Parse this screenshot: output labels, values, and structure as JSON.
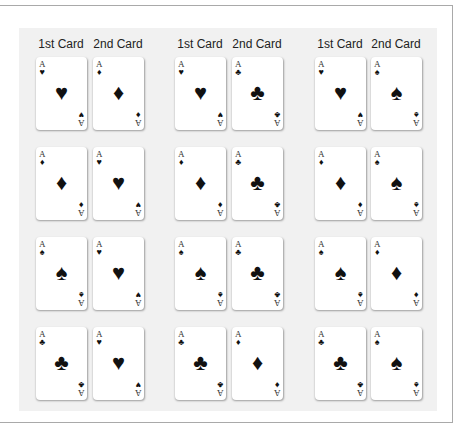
{
  "headers": [
    "1st Card",
    "2nd Card",
    "1st Card",
    "2nd Card",
    "1st Card",
    "2nd Card"
  ],
  "suit_glyphs": {
    "hearts": "♥",
    "diamonds": "♦",
    "spades": "♠",
    "clubs": "♣"
  },
  "rank": "A",
  "rows": [
    {
      "pairs": [
        {
          "first": "hearts",
          "second": "diamonds"
        },
        {
          "first": "hearts",
          "second": "clubs"
        },
        {
          "first": "hearts",
          "second": "spades"
        }
      ]
    },
    {
      "pairs": [
        {
          "first": "diamonds",
          "second": "hearts"
        },
        {
          "first": "diamonds",
          "second": "clubs"
        },
        {
          "first": "diamonds",
          "second": "spades"
        }
      ]
    },
    {
      "pairs": [
        {
          "first": "spades",
          "second": "hearts"
        },
        {
          "first": "spades",
          "second": "clubs"
        },
        {
          "first": "spades",
          "second": "diamonds"
        }
      ]
    },
    {
      "pairs": [
        {
          "first": "clubs",
          "second": "hearts"
        },
        {
          "first": "clubs",
          "second": "diamonds"
        },
        {
          "first": "clubs",
          "second": "spades"
        }
      ]
    }
  ],
  "colors": {
    "panel": "#f1f1f1",
    "frame_border": "#a9a9a9",
    "card": "#ffffff",
    "pip": "#111111"
  }
}
